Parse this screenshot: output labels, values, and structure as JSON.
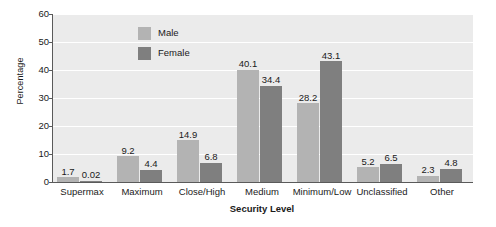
{
  "chart_data": {
    "type": "bar",
    "title": "",
    "xlabel": "Security Level",
    "ylabel": "Percentage",
    "categories": [
      "Supermax",
      "Maximum",
      "Close/High",
      "Medium",
      "Minimum/Low",
      "Unclassified",
      "Other"
    ],
    "series": [
      {
        "name": "Male",
        "color": "#b3b3b3",
        "values": [
          1.7,
          9.2,
          14.9,
          40.1,
          28.2,
          5.2,
          2.3
        ]
      },
      {
        "name": "Female",
        "color": "#7f7f7f",
        "values": [
          0.02,
          4.4,
          6.8,
          34.4,
          43.1,
          6.5,
          4.8
        ]
      }
    ],
    "value_labels": {
      "Male": [
        "1.7",
        "9.2",
        "14.9",
        "40.1",
        "28.2",
        "5.2",
        "2.3"
      ],
      "Female": [
        "0.02",
        "4.4",
        "6.8",
        "34.4",
        "43.1",
        "6.5",
        "4.8"
      ]
    },
    "ylim": [
      0,
      60
    ],
    "yticks": [
      0,
      10,
      20,
      30,
      40,
      50,
      60
    ],
    "ytick_labels": [
      "0",
      "10",
      "20",
      "30",
      "40",
      "50",
      "60"
    ],
    "grid": "horizontal-white",
    "legend_position": "top-center",
    "plot_background": "#ebebeb",
    "figure_background": "#ffffff"
  },
  "legend": {
    "items": [
      {
        "label": "Male"
      },
      {
        "label": "Female"
      }
    ]
  }
}
